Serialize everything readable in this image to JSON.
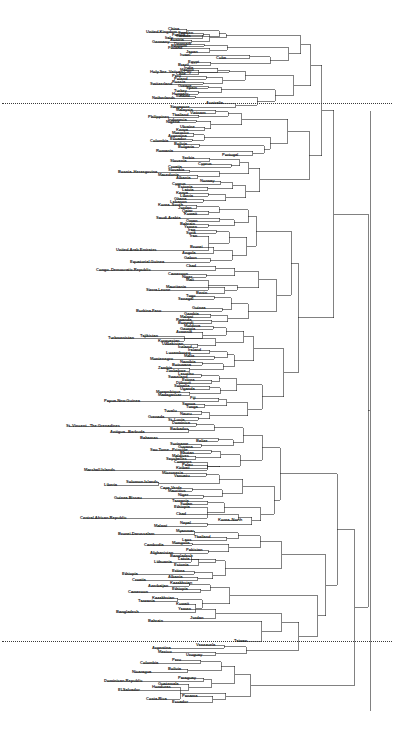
{
  "figure": {
    "type": "dendrogram",
    "orientation": "horizontal-right",
    "width": 396,
    "height": 737,
    "background": "#ffffff",
    "line_color": "#1a1a1a",
    "label_color": "#1a1a1a",
    "cut_line_color": "#3a3a3a",
    "cut_line_style": "dotted"
  },
  "chart_data": {
    "type": "dendrogram",
    "title": "",
    "subtitle": "",
    "xlabel": "",
    "ylabel": "",
    "grid": false,
    "legend": "none",
    "cut_lines": [
      {
        "name": "upper-cut",
        "y": 103,
        "note": "dotted horizontal cut line"
      },
      {
        "name": "lower-cut",
        "y": 641,
        "note": "dotted horizontal cut line"
      }
    ],
    "root_x": 370,
    "leaf_count": 182,
    "clusters": [
      {
        "name": "cluster-1",
        "range": [
          0,
          102
        ],
        "anchor_labels": [
          "United.Kingdom",
          "Germany",
          "Japan",
          "Cuba",
          "Holy.See..Vatican.City",
          "Switzerland",
          "Netherlands"
        ]
      },
      {
        "name": "cluster-2",
        "range": [
          103,
          640
        ],
        "anchor_labels": [
          "Australia",
          "Portugal",
          "Cyprus",
          "Norway",
          "Bosnia..Herzegovina",
          "Congo..Democratic.Republic",
          "Burkina.Faso",
          "Papua.New.Guinea",
          "Marshall.Islands",
          "Central.African.Republic",
          "Korea..North"
        ]
      },
      {
        "name": "cluster-3",
        "range": [
          641,
          737
        ],
        "anchor_labels": [
          "Taiwan",
          "Venezuela",
          "Uruguay",
          "Colombia",
          "Paraguay",
          "Dominican.Republic",
          "El.Salvador",
          "Panama"
        ]
      }
    ],
    "leaves": [
      {
        "label": "United.Kingdom",
        "x": 146,
        "y": 32
      },
      {
        "label": "China",
        "x": 168,
        "y": 29
      },
      {
        "label": "France",
        "x": 172,
        "y": 35
      },
      {
        "label": "Italy",
        "x": 165,
        "y": 38
      },
      {
        "label": "Sweden",
        "x": 178,
        "y": 33
      },
      {
        "label": "Canada",
        "x": 176,
        "y": 36
      },
      {
        "label": "Germany",
        "x": 152,
        "y": 42
      },
      {
        "label": "Austria",
        "x": 170,
        "y": 40
      },
      {
        "label": "Denmark",
        "x": 174,
        "y": 44
      },
      {
        "label": "Belgium",
        "x": 171,
        "y": 46
      },
      {
        "label": "Finland",
        "x": 168,
        "y": 48
      },
      {
        "label": "Japan",
        "x": 186,
        "y": 52
      },
      {
        "label": "Israel",
        "x": 180,
        "y": 55
      },
      {
        "label": "Cuba",
        "x": 216,
        "y": 58
      },
      {
        "label": "Egypt",
        "x": 188,
        "y": 62
      },
      {
        "label": "Brazil",
        "x": 178,
        "y": 65
      },
      {
        "label": "Holy.See..Vatican.City",
        "x": 150,
        "y": 72
      },
      {
        "label": "India",
        "x": 184,
        "y": 68
      },
      {
        "label": "Mexico",
        "x": 180,
        "y": 70
      },
      {
        "label": "Chile",
        "x": 176,
        "y": 74
      },
      {
        "label": "Peru",
        "x": 172,
        "y": 76
      },
      {
        "label": "Poland",
        "x": 174,
        "y": 79
      },
      {
        "label": "Switzerland",
        "x": 150,
        "y": 84
      },
      {
        "label": "Russia",
        "x": 172,
        "y": 82
      },
      {
        "label": "Spain",
        "x": 186,
        "y": 88
      },
      {
        "label": "Greece",
        "x": 178,
        "y": 86
      },
      {
        "label": "Turkey",
        "x": 174,
        "y": 91
      },
      {
        "label": "Hungary",
        "x": 172,
        "y": 94
      },
      {
        "label": "Netherlands",
        "x": 152,
        "y": 98
      },
      {
        "label": "Iceland",
        "x": 176,
        "y": 96
      },
      {
        "label": "Australia",
        "x": 206,
        "y": 103
      },
      {
        "label": "Singapore",
        "x": 170,
        "y": 107
      },
      {
        "label": "Malaysia",
        "x": 176,
        "y": 110
      },
      {
        "label": "Vietnam",
        "x": 190,
        "y": 113
      },
      {
        "label": "Philippines",
        "x": 148,
        "y": 117
      },
      {
        "label": "Thailand",
        "x": 172,
        "y": 115
      },
      {
        "label": "Indonesia",
        "x": 168,
        "y": 120
      },
      {
        "label": "Nigeria",
        "x": 166,
        "y": 122
      },
      {
        "label": "Ukraine",
        "x": 180,
        "y": 127
      },
      {
        "label": "Kenya",
        "x": 176,
        "y": 130
      },
      {
        "label": "Morocco",
        "x": 172,
        "y": 133
      },
      {
        "label": "Argentina",
        "x": 168,
        "y": 136
      },
      {
        "label": "Colombia",
        "x": 150,
        "y": 141
      },
      {
        "label": "Ecuador",
        "x": 170,
        "y": 139
      },
      {
        "label": "Bolivia",
        "x": 174,
        "y": 144
      },
      {
        "label": "Bulgaria",
        "x": 178,
        "y": 147
      },
      {
        "label": "Romania",
        "x": 156,
        "y": 151
      },
      {
        "label": "Portugal",
        "x": 222,
        "y": 155
      },
      {
        "label": "Serbia",
        "x": 182,
        "y": 158
      },
      {
        "label": "Slovenia",
        "x": 170,
        "y": 161
      },
      {
        "label": "Cyprus",
        "x": 198,
        "y": 164
      },
      {
        "label": "Croatia",
        "x": 168,
        "y": 167
      },
      {
        "label": "Bosnia..Herzegovina",
        "x": 118,
        "y": 172
      },
      {
        "label": "Slovakia",
        "x": 168,
        "y": 170
      },
      {
        "label": "Macedonia",
        "x": 158,
        "y": 175
      },
      {
        "label": "Albania",
        "x": 176,
        "y": 178
      },
      {
        "label": "Norway",
        "x": 200,
        "y": 181
      },
      {
        "label": "Cyprus.2",
        "x": 172,
        "y": 184
      },
      {
        "label": "Estonia",
        "x": 178,
        "y": 187
      },
      {
        "label": "Latvia",
        "x": 182,
        "y": 190
      },
      {
        "label": "Kenya.2",
        "x": 176,
        "y": 193
      },
      {
        "label": "Liberia",
        "x": 180,
        "y": 196
      },
      {
        "label": "Ghana",
        "x": 174,
        "y": 199
      },
      {
        "label": "Lebanon",
        "x": 170,
        "y": 202
      },
      {
        "label": "Korea..South",
        "x": 158,
        "y": 205
      },
      {
        "label": "Jordan",
        "x": 178,
        "y": 208
      },
      {
        "label": "Qatar",
        "x": 182,
        "y": 211
      },
      {
        "label": "Kuwait",
        "x": 184,
        "y": 214
      },
      {
        "label": "Saudi.Arabia",
        "x": 156,
        "y": 218
      },
      {
        "label": "Oman",
        "x": 186,
        "y": 221
      },
      {
        "label": "Bahrain",
        "x": 180,
        "y": 224
      },
      {
        "label": "Yemen",
        "x": 184,
        "y": 227
      },
      {
        "label": "Iraq",
        "x": 188,
        "y": 230
      },
      {
        "label": "Syria",
        "x": 186,
        "y": 233
      },
      {
        "label": "Iran",
        "x": 190,
        "y": 236
      },
      {
        "label": "United.Arab.Emirates",
        "x": 116,
        "y": 250
      },
      {
        "label": "Brunei",
        "x": 190,
        "y": 247
      },
      {
        "label": "Angola",
        "x": 182,
        "y": 253
      },
      {
        "label": "Equatorial.Guinea",
        "x": 130,
        "y": 262
      },
      {
        "label": "Gabon",
        "x": 184,
        "y": 258
      },
      {
        "label": "Congo..Democratic.Republic",
        "x": 96,
        "y": 270
      },
      {
        "label": "Chad",
        "x": 186,
        "y": 266
      },
      {
        "label": "Cameroon",
        "x": 168,
        "y": 274
      },
      {
        "label": "Niger",
        "x": 182,
        "y": 277
      },
      {
        "label": "Mali",
        "x": 186,
        "y": 280
      },
      {
        "label": "Sierra.Leone",
        "x": 146,
        "y": 290
      },
      {
        "label": "Mauritania",
        "x": 166,
        "y": 287
      },
      {
        "label": "Benin",
        "x": 196,
        "y": 293
      },
      {
        "label": "Togo",
        "x": 186,
        "y": 296
      },
      {
        "label": "Senegal",
        "x": 178,
        "y": 299
      },
      {
        "label": "Burkina.Faso",
        "x": 136,
        "y": 311
      },
      {
        "label": "Guinea",
        "x": 192,
        "y": 308
      },
      {
        "label": "Gambia",
        "x": 184,
        "y": 314
      },
      {
        "label": "Malawi",
        "x": 180,
        "y": 317
      },
      {
        "label": "Rwanda",
        "x": 176,
        "y": 320
      },
      {
        "label": "Burundi",
        "x": 178,
        "y": 323
      },
      {
        "label": "Moldova",
        "x": 184,
        "y": 326
      },
      {
        "label": "Georgia",
        "x": 180,
        "y": 329
      },
      {
        "label": "Armenia",
        "x": 176,
        "y": 332
      },
      {
        "label": "Turkmenistan",
        "x": 108,
        "y": 338
      },
      {
        "label": "Tajikistan",
        "x": 140,
        "y": 336
      },
      {
        "label": "Kyrgyzstan",
        "x": 158,
        "y": 341
      },
      {
        "label": "Uzbekistan",
        "x": 162,
        "y": 344
      },
      {
        "label": "Iceland.2",
        "x": 178,
        "y": 347
      },
      {
        "label": "Ireland",
        "x": 188,
        "y": 350
      },
      {
        "label": "Luxembourg",
        "x": 166,
        "y": 353
      },
      {
        "label": "Malta",
        "x": 184,
        "y": 356
      },
      {
        "label": "Montenegro",
        "x": 150,
        "y": 359
      },
      {
        "label": "Namibia",
        "x": 180,
        "y": 362
      },
      {
        "label": "Botswana",
        "x": 172,
        "y": 365
      },
      {
        "label": "Zambia",
        "x": 158,
        "y": 368
      },
      {
        "label": "Zimbabwe",
        "x": 166,
        "y": 371
      },
      {
        "label": "Lesotho",
        "x": 178,
        "y": 374
      },
      {
        "label": "Swaziland",
        "x": 168,
        "y": 377
      },
      {
        "label": "Eritrea",
        "x": 182,
        "y": 380
      },
      {
        "label": "Djibouti",
        "x": 176,
        "y": 383
      },
      {
        "label": "Somalia",
        "x": 174,
        "y": 386
      },
      {
        "label": "Uganda",
        "x": 180,
        "y": 389
      },
      {
        "label": "Mozambique",
        "x": 156,
        "y": 392
      },
      {
        "label": "Madagascar",
        "x": 158,
        "y": 395
      },
      {
        "label": "Papua.New.Guinea",
        "x": 104,
        "y": 401
      },
      {
        "label": "Fiji",
        "x": 190,
        "y": 398
      },
      {
        "label": "Samoa",
        "x": 182,
        "y": 404
      },
      {
        "label": "Tonga",
        "x": 186,
        "y": 407
      },
      {
        "label": "Tuvalu",
        "x": 164,
        "y": 411
      },
      {
        "label": "Nauru",
        "x": 180,
        "y": 414
      },
      {
        "label": "Grenada",
        "x": 148,
        "y": 417
      },
      {
        "label": "St..Lucia",
        "x": 168,
        "y": 420
      },
      {
        "label": "St..Vincent...The.Grenadines",
        "x": 66,
        "y": 426
      },
      {
        "label": "Dominica",
        "x": 172,
        "y": 423
      },
      {
        "label": "Antigua...Barbuda",
        "x": 110,
        "y": 432
      },
      {
        "label": "Barbados",
        "x": 170,
        "y": 429
      },
      {
        "label": "Bahamas",
        "x": 140,
        "y": 438
      },
      {
        "label": "Belize",
        "x": 196,
        "y": 441
      },
      {
        "label": "Suriname",
        "x": 170,
        "y": 444
      },
      {
        "label": "Guyana",
        "x": 178,
        "y": 447
      },
      {
        "label": "Sao.Tome...Principe",
        "x": 150,
        "y": 450
      },
      {
        "label": "Bhutan",
        "x": 180,
        "y": 453
      },
      {
        "label": "Maldives",
        "x": 172,
        "y": 456
      },
      {
        "label": "Seychelles",
        "x": 166,
        "y": 459
      },
      {
        "label": "Comoros",
        "x": 174,
        "y": 462
      },
      {
        "label": "Marshall.Islands",
        "x": 84,
        "y": 470
      },
      {
        "label": "Palau",
        "x": 182,
        "y": 465
      },
      {
        "label": "Kiribati",
        "x": 176,
        "y": 468
      },
      {
        "label": "Micronesia",
        "x": 162,
        "y": 473
      },
      {
        "label": "Vanuatu",
        "x": 174,
        "y": 476
      },
      {
        "label": "Solomon.Islands",
        "x": 126,
        "y": 482
      },
      {
        "label": "Liberia.2",
        "x": 104,
        "y": 485
      },
      {
        "label": "Cape.Verde",
        "x": 160,
        "y": 488
      },
      {
        "label": "Mauritius",
        "x": 168,
        "y": 491
      },
      {
        "label": "Guinea.Bissau",
        "x": 114,
        "y": 498
      },
      {
        "label": "Niger.2",
        "x": 178,
        "y": 495
      },
      {
        "label": "Tanzania",
        "x": 172,
        "y": 501
      },
      {
        "label": "Sudan",
        "x": 180,
        "y": 504
      },
      {
        "label": "Ethiopia",
        "x": 174,
        "y": 507
      },
      {
        "label": "Central.African.Republic",
        "x": 80,
        "y": 518
      },
      {
        "label": "Korea..North",
        "x": 218,
        "y": 520
      },
      {
        "label": "Chad.2",
        "x": 176,
        "y": 514
      },
      {
        "label": "Malawi.2",
        "x": 154,
        "y": 526
      },
      {
        "label": "Nepal",
        "x": 180,
        "y": 523
      },
      {
        "label": "Brunei.Darussalam",
        "x": 118,
        "y": 534
      },
      {
        "label": "Myanmar",
        "x": 176,
        "y": 531
      },
      {
        "label": "Thailand.2",
        "x": 194,
        "y": 537
      },
      {
        "label": "Laos",
        "x": 182,
        "y": 540
      },
      {
        "label": "Cambodia",
        "x": 144,
        "y": 545
      },
      {
        "label": "Mongolia",
        "x": 172,
        "y": 543
      },
      {
        "label": "Afghanistan",
        "x": 150,
        "y": 553
      },
      {
        "label": "Pakistan",
        "x": 186,
        "y": 550
      },
      {
        "label": "Bangladesh",
        "x": 170,
        "y": 556
      },
      {
        "label": "Lithuania",
        "x": 154,
        "y": 562
      },
      {
        "label": "Latvia.2",
        "x": 178,
        "y": 559
      },
      {
        "label": "Estonia.2",
        "x": 174,
        "y": 565
      },
      {
        "label": "Ethiopia.2",
        "x": 122,
        "y": 574
      },
      {
        "label": "Eritrea.2",
        "x": 172,
        "y": 571
      },
      {
        "label": "Croatia.2",
        "x": 132,
        "y": 580
      },
      {
        "label": "Albania.2",
        "x": 168,
        "y": 577
      },
      {
        "label": "Azerbaijan",
        "x": 148,
        "y": 586
      },
      {
        "label": "Kazakhstan",
        "x": 170,
        "y": 583
      },
      {
        "label": "Cameroon.2",
        "x": 128,
        "y": 592
      },
      {
        "label": "Ethiopia.3",
        "x": 172,
        "y": 589
      },
      {
        "label": "Kazakhstan.2",
        "x": 152,
        "y": 598
      },
      {
        "label": "Tanzania.2",
        "x": 138,
        "y": 601
      },
      {
        "label": "Kuwait.2",
        "x": 176,
        "y": 604
      },
      {
        "label": "Bangladesh.2",
        "x": 116,
        "y": 612
      },
      {
        "label": "Yemen.2",
        "x": 178,
        "y": 609
      },
      {
        "label": "Jordan",
        "x": 190,
        "y": 618
      },
      {
        "label": "Bahrain.2",
        "x": 148,
        "y": 621
      },
      {
        "label": "Taiwan",
        "x": 234,
        "y": 641
      },
      {
        "label": "Venezuela",
        "x": 196,
        "y": 645
      },
      {
        "label": "Argentina.2",
        "x": 152,
        "y": 648
      },
      {
        "label": "Mexico.2",
        "x": 158,
        "y": 652
      },
      {
        "label": "Uruguay",
        "x": 186,
        "y": 655
      },
      {
        "label": "Colombia.2",
        "x": 140,
        "y": 663
      },
      {
        "label": "Peru.2",
        "x": 172,
        "y": 660
      },
      {
        "label": "Nicaragua",
        "x": 132,
        "y": 672
      },
      {
        "label": "Bolivia.2",
        "x": 168,
        "y": 669
      },
      {
        "label": "Paraguay",
        "x": 178,
        "y": 678
      },
      {
        "label": "Dominican.Republic",
        "x": 104,
        "y": 681
      },
      {
        "label": "Guatemala",
        "x": 158,
        "y": 684
      },
      {
        "label": "El.Salvador",
        "x": 118,
        "y": 690
      },
      {
        "label": "Honduras",
        "x": 152,
        "y": 687
      },
      {
        "label": "Costa.Rica",
        "x": 146,
        "y": 699
      },
      {
        "label": "Panama",
        "x": 182,
        "y": 696
      },
      {
        "label": "Ecuador.2",
        "x": 172,
        "y": 702
      }
    ]
  }
}
